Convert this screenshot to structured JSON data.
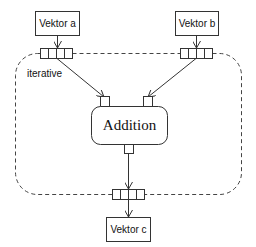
{
  "diagram": {
    "region_label": "iterative",
    "inputs": [
      {
        "id": "a",
        "label": "Vektor a"
      },
      {
        "id": "b",
        "label": "Vektor b"
      }
    ],
    "output": {
      "id": "c",
      "label": "Vektor c"
    },
    "operation": {
      "label": "Addition"
    },
    "edges": [
      {
        "from": "Vektor a",
        "to": "Addition input 1"
      },
      {
        "from": "Vektor b",
        "to": "Addition input 2"
      },
      {
        "from": "Addition output",
        "to": "Vektor c"
      }
    ]
  }
}
